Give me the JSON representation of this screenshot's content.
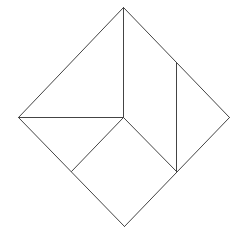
{
  "diagram": {
    "width": 241,
    "height": 240,
    "background": "#ffffff",
    "stroke": "#444444",
    "stroke_width": 1,
    "vertices": {
      "top": [
        123,
        7
      ],
      "left": [
        18,
        117
      ],
      "right": [
        229,
        117
      ],
      "bottom": [
        124,
        226
      ],
      "center": [
        123,
        117
      ],
      "right_inner_top": [
        176,
        62
      ],
      "right_inner_bottom": [
        176,
        171
      ],
      "left_inner_bottom": [
        71,
        171
      ]
    },
    "segments": [
      {
        "name": "outline-top-left",
        "from": "top",
        "to": "left"
      },
      {
        "name": "outline-top-right",
        "from": "top",
        "to": "right"
      },
      {
        "name": "outline-right-bottom",
        "from": "right",
        "to": "bottom"
      },
      {
        "name": "outline-left-bottom",
        "from": "left",
        "to": "bottom"
      },
      {
        "name": "vertical-top-center",
        "from": "top",
        "to": "center"
      },
      {
        "name": "horizontal-left-center",
        "from": "left",
        "to": "center"
      },
      {
        "name": "diagonal-center-left-inner",
        "from": "center",
        "to": "left_inner_bottom"
      },
      {
        "name": "diagonal-center-right-inner",
        "from": "center",
        "to": "right_inner_bottom"
      },
      {
        "name": "vertical-right-inner",
        "from": "right_inner_top",
        "to": "right_inner_bottom"
      }
    ]
  }
}
